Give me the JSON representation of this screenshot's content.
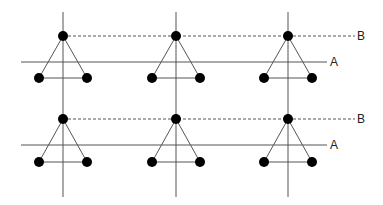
{
  "diagram": {
    "type": "lattice-of-triangles",
    "colors": {
      "line": "#555555",
      "dot": "#000000",
      "label": "#222222"
    },
    "columns_x": [
      63,
      176,
      288
    ],
    "vertical_line_range": [
      12,
      197
    ],
    "rows": [
      {
        "top_y": 36,
        "bottom_y": 78,
        "line_a": {
          "y": 62,
          "x1": 21,
          "x2": 327,
          "label": "A"
        },
        "line_b": {
          "y": 36,
          "x1": 63,
          "x2": 355,
          "label": "B",
          "style": "dashed"
        }
      },
      {
        "top_y": 119,
        "bottom_y": 162,
        "line_a": {
          "y": 145,
          "x1": 21,
          "x2": 327,
          "label": "A"
        },
        "line_b": {
          "y": 119,
          "x1": 63,
          "x2": 355,
          "label": "B",
          "style": "dashed"
        }
      }
    ],
    "triangle": {
      "half_base": 24,
      "dot_radius": 5
    }
  }
}
